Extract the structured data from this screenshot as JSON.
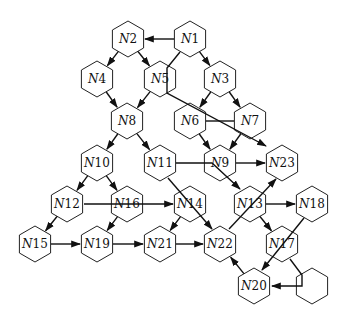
{
  "diagram": {
    "type": "directed-graph",
    "node_shape": "hexagon",
    "colors": {
      "stroke": "#222222",
      "fill": "#ffffff",
      "edge": "#111111"
    },
    "nodes": [
      {
        "id": "N1",
        "prefix": "N",
        "num": "1",
        "x": 190,
        "y": 39
      },
      {
        "id": "N2",
        "prefix": "N",
        "num": "2",
        "x": 128,
        "y": 39
      },
      {
        "id": "N3",
        "prefix": "N",
        "num": "3",
        "x": 220,
        "y": 79
      },
      {
        "id": "N4",
        "prefix": "N",
        "num": "4",
        "x": 97,
        "y": 79
      },
      {
        "id": "N5",
        "prefix": "N",
        "num": "5",
        "x": 160,
        "y": 79
      },
      {
        "id": "N6",
        "prefix": "N",
        "num": "6",
        "x": 190,
        "y": 121
      },
      {
        "id": "N7",
        "prefix": "N",
        "num": "7",
        "x": 250,
        "y": 121
      },
      {
        "id": "N8",
        "prefix": "N",
        "num": "8",
        "x": 127,
        "y": 121
      },
      {
        "id": "N9",
        "prefix": "N",
        "num": "9",
        "x": 220,
        "y": 163
      },
      {
        "id": "N10",
        "prefix": "N",
        "num": "10",
        "x": 97,
        "y": 163
      },
      {
        "id": "N11",
        "prefix": "N",
        "num": "11",
        "x": 160,
        "y": 163
      },
      {
        "id": "N12",
        "prefix": "N",
        "num": "12",
        "x": 67,
        "y": 204
      },
      {
        "id": "N13",
        "prefix": "N",
        "num": "13",
        "x": 250,
        "y": 204
      },
      {
        "id": "N14",
        "prefix": "N",
        "num": "14",
        "x": 190,
        "y": 204
      },
      {
        "id": "N15",
        "prefix": "N",
        "num": "15",
        "x": 35,
        "y": 244
      },
      {
        "id": "N16",
        "prefix": "N",
        "num": "16",
        "x": 127,
        "y": 204
      },
      {
        "id": "N17",
        "prefix": "N",
        "num": "17",
        "x": 282,
        "y": 244
      },
      {
        "id": "N18",
        "prefix": "N",
        "num": "18",
        "x": 312,
        "y": 204
      },
      {
        "id": "N19",
        "prefix": "N",
        "num": "19",
        "x": 97,
        "y": 244
      },
      {
        "id": "N20",
        "prefix": "N",
        "num": "20",
        "x": 254,
        "y": 286
      },
      {
        "id": "N21",
        "prefix": "N",
        "num": "21",
        "x": 160,
        "y": 244
      },
      {
        "id": "N22",
        "prefix": "N",
        "num": "22",
        "x": 220,
        "y": 244
      },
      {
        "id": "N23",
        "prefix": "N",
        "num": "23",
        "x": 282,
        "y": 163
      },
      {
        "id": "blank",
        "prefix": "",
        "num": "",
        "x": 312,
        "y": 286
      }
    ],
    "edges": [
      {
        "from": "N1",
        "to": "N2",
        "arrow": true
      },
      {
        "from": "N1",
        "to": "N3",
        "arrow": true
      },
      {
        "from": "N2",
        "to": "N4",
        "arrow": true
      },
      {
        "from": "N2",
        "to": "N5",
        "arrow": true
      },
      {
        "from": "N1",
        "to": "N23",
        "arrow": true,
        "via": "N5,N6,N7"
      },
      {
        "from": "N3",
        "to": "N6",
        "arrow": true
      },
      {
        "from": "N3",
        "to": "N7",
        "arrow": true
      },
      {
        "from": "N4",
        "to": "N8",
        "arrow": true
      },
      {
        "from": "N5",
        "to": "N8",
        "arrow": true
      },
      {
        "from": "N6",
        "to": "N7",
        "arrow": false
      },
      {
        "from": "N6",
        "to": "N9",
        "arrow": true
      },
      {
        "from": "N7",
        "to": "N9",
        "arrow": true
      },
      {
        "from": "N8",
        "to": "N10",
        "arrow": true
      },
      {
        "from": "N8",
        "to": "N11",
        "arrow": true
      },
      {
        "from": "N9",
        "to": "N23",
        "arrow": true
      },
      {
        "from": "N11",
        "to": "N13",
        "arrow": true,
        "via": "N9"
      },
      {
        "from": "N11",
        "to": "N22",
        "arrow": true,
        "via": "N14"
      },
      {
        "from": "N10",
        "to": "N12",
        "arrow": true
      },
      {
        "from": "N10",
        "to": "N16",
        "arrow": true
      },
      {
        "from": "N12",
        "to": "N14",
        "arrow": true,
        "via": "N16"
      },
      {
        "from": "N12",
        "to": "N15",
        "arrow": true
      },
      {
        "from": "N16",
        "to": "N19",
        "arrow": true
      },
      {
        "from": "N14",
        "to": "N21",
        "arrow": true
      },
      {
        "from": "N22",
        "to": "N23",
        "arrow": true,
        "via": "N13"
      },
      {
        "from": "N13",
        "to": "N18",
        "arrow": true
      },
      {
        "from": "N13",
        "to": "N17",
        "arrow": true
      },
      {
        "from": "N15",
        "to": "N19",
        "arrow": true
      },
      {
        "from": "N19",
        "to": "N21",
        "arrow": true
      },
      {
        "from": "N21",
        "to": "N22",
        "arrow": true
      },
      {
        "from": "N18",
        "to": "N20",
        "arrow": true,
        "via": "N17"
      },
      {
        "from": "N17",
        "to": "N20",
        "arrow": true,
        "via": "blank"
      },
      {
        "from": "N20",
        "to": "N22",
        "arrow": true
      }
    ]
  }
}
